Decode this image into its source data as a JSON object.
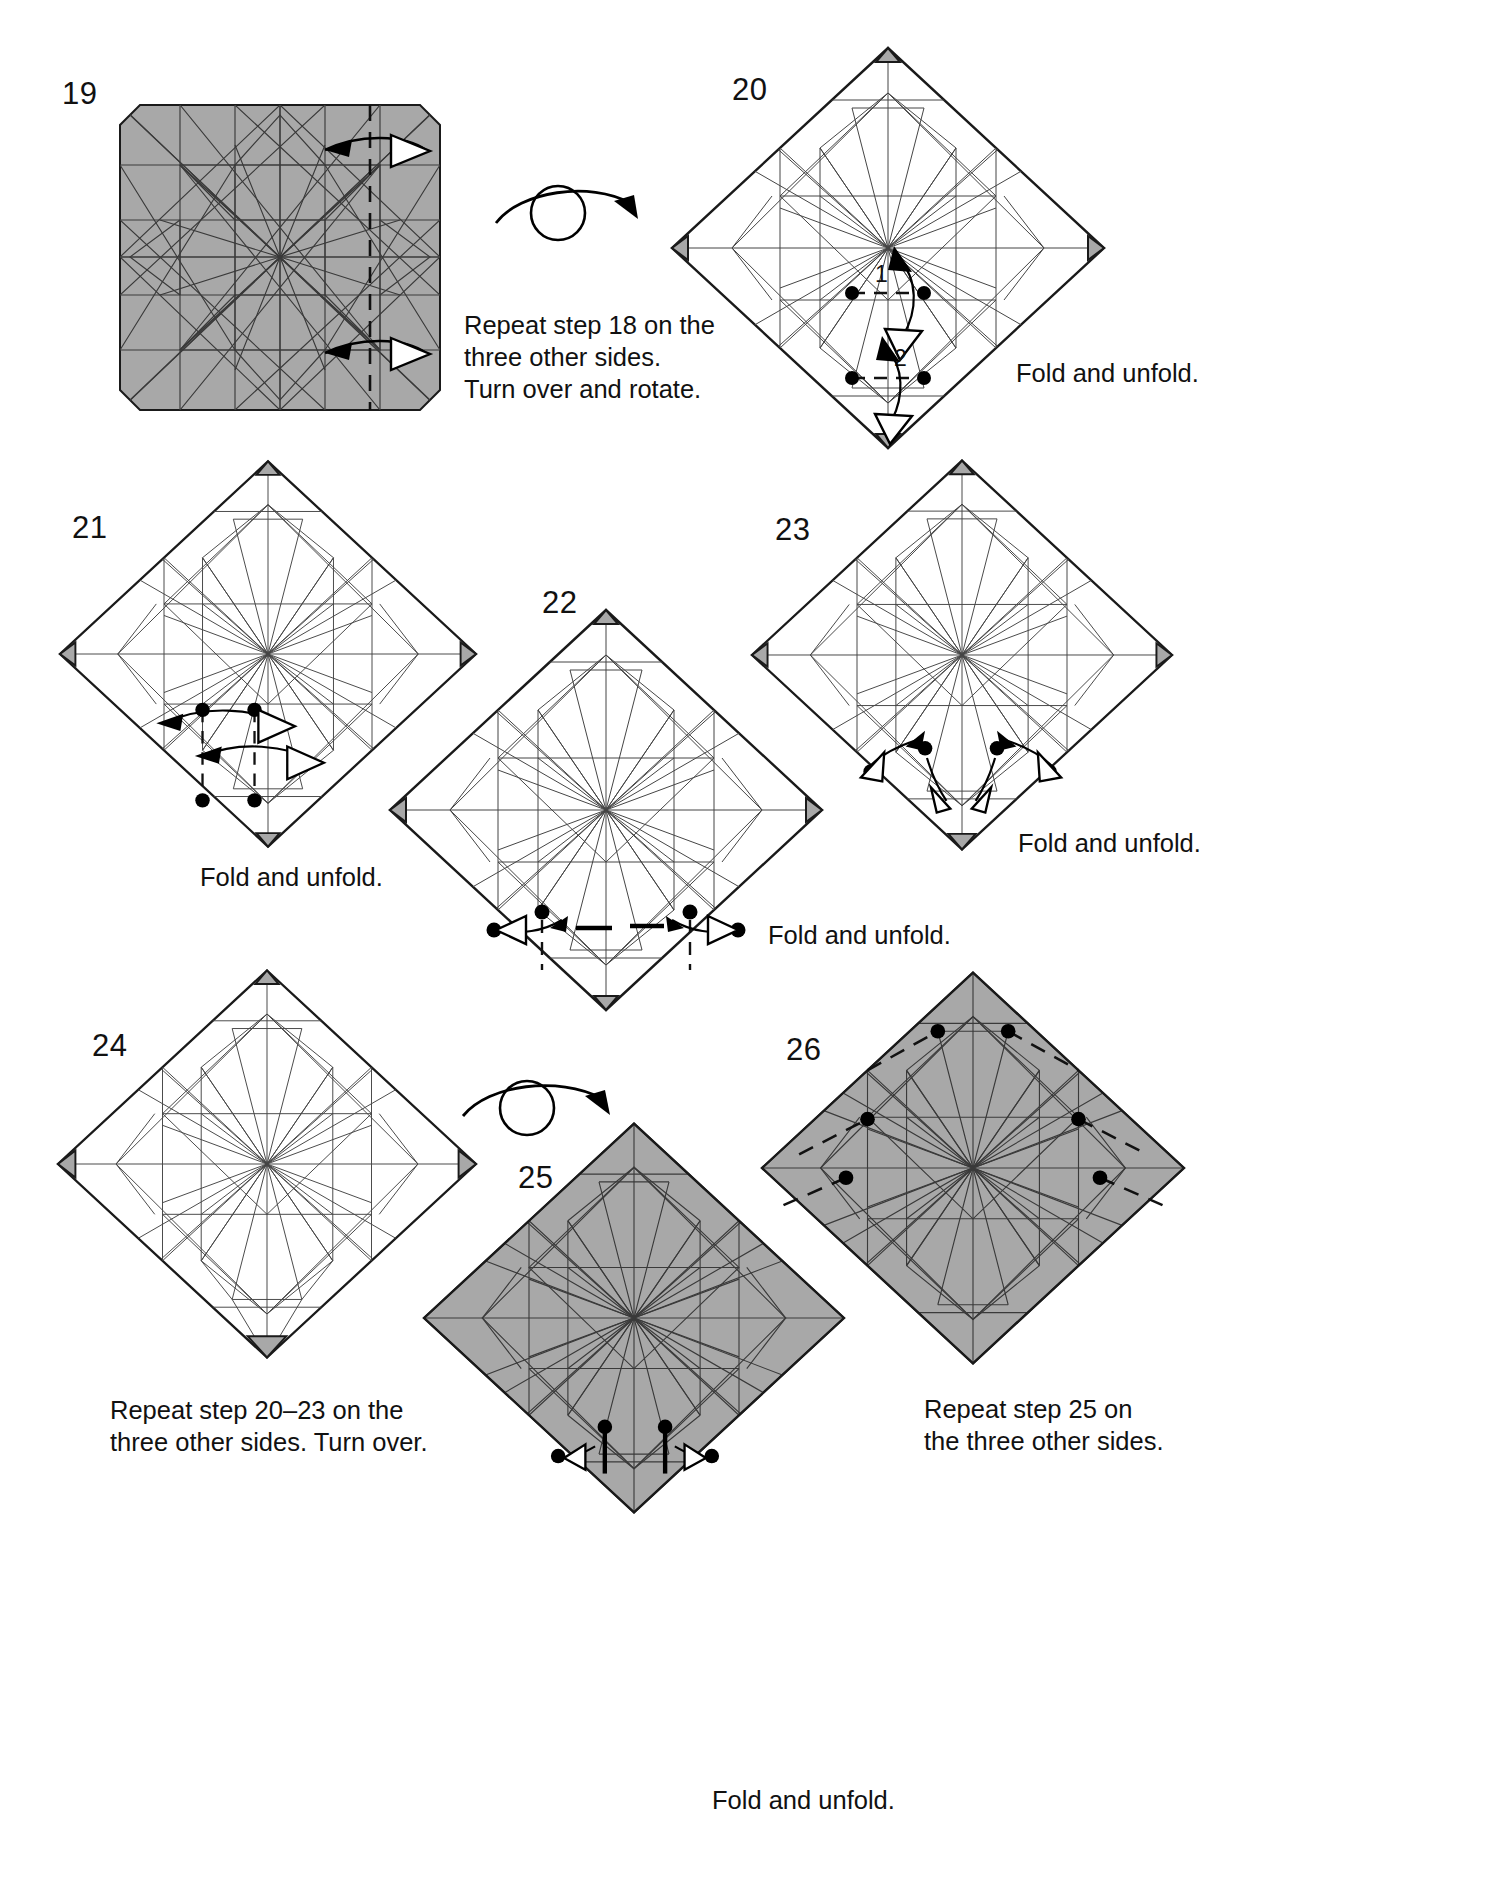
{
  "document": {
    "type": "origami-instruction-diagram",
    "width": 1486,
    "height": 1884,
    "background": "#ffffff",
    "paper_shade": "#a8a8a8",
    "line_color": "#1a1a1a"
  },
  "steps": [
    {
      "number": "19",
      "shape": "square",
      "shading": "gray",
      "caption": "",
      "markings": [
        "valley-fold-vertical-dashed",
        "two-fold-arrows-pointing-left"
      ]
    },
    {
      "number": "20",
      "shape": "diamond",
      "shading": "white",
      "caption": "Fold and unfold.",
      "labels": [
        "1",
        "2"
      ],
      "markings": [
        "dashed-segment-with-endpoint-dots",
        "double-headed-fold-arrow-1",
        "double-headed-fold-arrow-2"
      ]
    },
    {
      "number": "21",
      "shape": "diamond",
      "shading": "white",
      "caption": "Fold and unfold.",
      "markings": [
        "two-vertical-dashed-creases",
        "four-endpoint-dots",
        "two-double-headed-horizontal-arrows"
      ]
    },
    {
      "number": "22",
      "shape": "diamond",
      "shading": "white",
      "caption": "Fold and unfold.",
      "markings": [
        "two-vertical-dashed-creases",
        "four-dots",
        "two-outward-fold-arrows",
        "two-thick-reference-segments"
      ]
    },
    {
      "number": "23",
      "shape": "diamond",
      "shading": "white",
      "caption": "Fold and unfold.",
      "markings": [
        "four-dots",
        "four-splaying-fold-arrows"
      ]
    },
    {
      "number": "24",
      "shape": "diamond",
      "shading": "white",
      "caption": "Repeat step 20–23 on the\nthree other sides. Turn over.",
      "markings": []
    },
    {
      "number": "25",
      "shape": "diamond",
      "shading": "gray",
      "caption": "Fold and unfold.",
      "markings": [
        "four-dots",
        "two-thick-vertical-segments",
        "two-outward-fold-arrows"
      ]
    },
    {
      "number": "26",
      "shape": "diamond",
      "shading": "gray",
      "caption": "Repeat step 25 on\nthe three other sides.",
      "markings": [
        "four-long-dashed-valley-creases",
        "six-dots"
      ]
    }
  ],
  "instructions": {
    "turn_over_19_to_20": "Repeat step 18 on the\nthree other sides.\nTurn over and rotate.",
    "fold_and_unfold": "Fold and unfold.",
    "repeat_20_23": "Repeat step 20–23 on the\nthree other sides. Turn over.",
    "repeat_25": "Repeat step 25 on\nthe three other sides."
  },
  "symbols": {
    "turn_over_icon": "turn-over-circle-arrow",
    "fold_arrow": "hollow-triangle-arrowhead",
    "unfold_arrow": "solid-arrowhead",
    "reference_point": "filled-dot",
    "valley_fold": "dashed-line"
  }
}
